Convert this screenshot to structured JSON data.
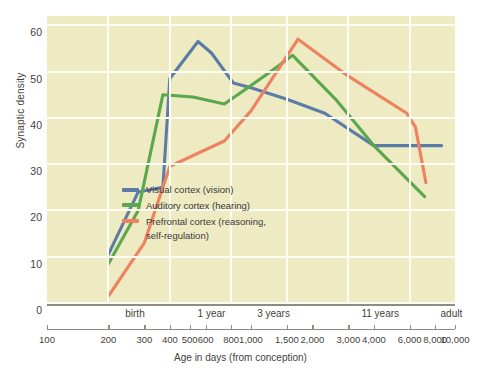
{
  "chart_data": {
    "type": "line",
    "title": "",
    "xlabel": "Age in days (from conception)",
    "ylabel": "Synaptic density",
    "xscale": "log",
    "xlim": [
      100,
      10000
    ],
    "ylim": [
      0,
      62
    ],
    "grid": true,
    "legend_position": "center-left inside plot",
    "y_ticks": [
      0,
      10,
      20,
      30,
      40,
      50,
      60
    ],
    "x_ticks": [
      100,
      200,
      300,
      400,
      500,
      600,
      800,
      1000,
      1500,
      2000,
      3000,
      4000,
      6000,
      8000,
      10000
    ],
    "x_tick_labels": [
      "100",
      "200",
      "300",
      "400",
      "500",
      "600",
      "800",
      "1,000",
      "1,500",
      "2,000",
      "3,000",
      "4,000",
      "6,000",
      "8,000",
      "10,000"
    ],
    "x_band_labels": [
      {
        "label": "birth",
        "x": 270
      },
      {
        "label": "1 year",
        "x": 640
      },
      {
        "label": "3 years",
        "x": 1290
      },
      {
        "label": "11 years",
        "x": 4300
      },
      {
        "label": "adult",
        "x": 9600
      }
    ],
    "series": [
      {
        "name": "Visual cortex (vision)",
        "color": "#5c7ca8",
        "points": [
          {
            "x": 200,
            "y": 10.5
          },
          {
            "x": 280,
            "y": 24
          },
          {
            "x": 370,
            "y": 25
          },
          {
            "x": 400,
            "y": 48.5
          },
          {
            "x": 550,
            "y": 56.5
          },
          {
            "x": 640,
            "y": 54
          },
          {
            "x": 820,
            "y": 47.5
          },
          {
            "x": 1000,
            "y": 46.5
          },
          {
            "x": 1500,
            "y": 44
          },
          {
            "x": 2300,
            "y": 41
          },
          {
            "x": 4000,
            "y": 34
          },
          {
            "x": 8600,
            "y": 34
          }
        ]
      },
      {
        "name": "Auditory cortex (hearing)",
        "color": "#5aa84d",
        "points": [
          {
            "x": 200,
            "y": 8.5
          },
          {
            "x": 280,
            "y": 20
          },
          {
            "x": 370,
            "y": 45
          },
          {
            "x": 520,
            "y": 44.5
          },
          {
            "x": 740,
            "y": 43
          },
          {
            "x": 1000,
            "y": 47
          },
          {
            "x": 1250,
            "y": 50
          },
          {
            "x": 1600,
            "y": 53.5
          },
          {
            "x": 2600,
            "y": 44
          },
          {
            "x": 4000,
            "y": 34
          },
          {
            "x": 7100,
            "y": 23
          }
        ]
      },
      {
        "name": "Prefrontal cortex (reasoning, self-regulation)",
        "color": "#ee8160",
        "points": [
          {
            "x": 200,
            "y": 1.5
          },
          {
            "x": 300,
            "y": 13
          },
          {
            "x": 400,
            "y": 29.5
          },
          {
            "x": 740,
            "y": 35
          },
          {
            "x": 1000,
            "y": 41.5
          },
          {
            "x": 1250,
            "y": 48
          },
          {
            "x": 1700,
            "y": 57
          },
          {
            "x": 3000,
            "y": 49
          },
          {
            "x": 5800,
            "y": 41
          },
          {
            "x": 6400,
            "y": 38
          },
          {
            "x": 7200,
            "y": 26
          }
        ]
      }
    ]
  },
  "axes": {
    "ylabel": "Synaptic density",
    "xlabel": "Age in days (from conception)",
    "y_ticks": [
      "60",
      "50",
      "40",
      "30",
      "20",
      "10",
      "0"
    ],
    "x_numeric_labels": [
      "100",
      "200",
      "300",
      "400",
      "500",
      "600",
      "800",
      "1,000",
      "1,500",
      "2,000",
      "3,000",
      "4,000",
      "6,000",
      "8,000",
      "10,000"
    ],
    "x_band_labels": [
      "birth",
      "1 year",
      "3 years",
      "11 years",
      "adult"
    ]
  },
  "legend": {
    "items": [
      {
        "label": "Visual cortex (vision)",
        "color": "#5c7ca8"
      },
      {
        "label": "Auditory cortex (hearing)",
        "color": "#5aa84d"
      },
      {
        "label": "Prefrontal cortex (reasoning,\nself-regulation)",
        "color": "#ee8160"
      }
    ]
  },
  "colors": {
    "plot_background": "#eeeac2",
    "gridline": "#fdfcf2",
    "axis": "#8e8d85",
    "text": "#3f3f3a"
  }
}
